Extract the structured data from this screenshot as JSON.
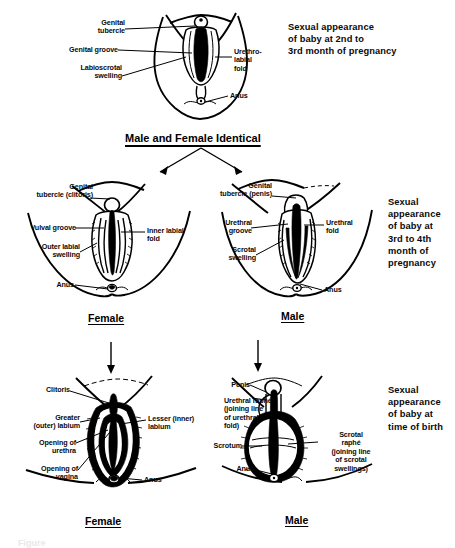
{
  "figure": {
    "title_caption": "Figure",
    "stages": [
      {
        "id": "stage-1",
        "description": "Sexual appearance\nof baby at 2nd to\n3rd month of pregnancy",
        "heading": "Male and Female Identical",
        "panels": [
          {
            "id": "indifferent",
            "sex_label": "",
            "labels": [
              {
                "name": "genital-tubercle",
                "text": "Genital\ntubercle"
              },
              {
                "name": "genital-groove",
                "text": "Genital groove"
              },
              {
                "name": "labioscrotal-swelling",
                "text": "Labioscrotal\nswelling"
              },
              {
                "name": "urethro-labial-fold",
                "text": "Urethro-\nlabial\nfold"
              },
              {
                "name": "anus",
                "text": "Anus"
              }
            ]
          }
        ]
      },
      {
        "id": "stage-2",
        "description": "Sexual\nappearance\nof baby at\n3rd to 4th\nmonth of\npregnancy",
        "heading": "",
        "panels": [
          {
            "id": "female-3to4-month",
            "sex_label": "Female",
            "labels": [
              {
                "name": "genital-tubercle-clitoris",
                "text": "Genital\ntubercle (clitoris)"
              },
              {
                "name": "vulval-groove",
                "text": "Vulval groove"
              },
              {
                "name": "outer-labial-swelling",
                "text": "Outer labial\nswelling"
              },
              {
                "name": "inner-labial-fold",
                "text": "Inner labial\nfold"
              },
              {
                "name": "anus",
                "text": "Anus"
              }
            ]
          },
          {
            "id": "male-3to4-month",
            "sex_label": "Male",
            "labels": [
              {
                "name": "genital-tubercle-penis",
                "text": "Genital\ntubercle (penis)"
              },
              {
                "name": "urethral-groove",
                "text": "Urethral\ngroove"
              },
              {
                "name": "scrotal-swelling",
                "text": "Scrotal\nswelling"
              },
              {
                "name": "urethral-fold",
                "text": "Urethral\nfold"
              },
              {
                "name": "anus",
                "text": "Anus"
              }
            ]
          }
        ]
      },
      {
        "id": "stage-3",
        "description": "Sexual\nappearance\nof baby at\ntime of birth",
        "heading": "",
        "panels": [
          {
            "id": "female-birth",
            "sex_label": "Female",
            "labels": [
              {
                "name": "clitoris",
                "text": "Clitoris"
              },
              {
                "name": "greater-outer-labium",
                "text": "Greater\n(outer) labium"
              },
              {
                "name": "opening-of-urethra",
                "text": "Opening of\nurethra"
              },
              {
                "name": "opening-of-vagina",
                "text": "Opening of\nvagina"
              },
              {
                "name": "lesser-inner-labium",
                "text": "Lesser (inner)\nlabium"
              },
              {
                "name": "anus",
                "text": "Anus"
              }
            ]
          },
          {
            "id": "male-birth",
            "sex_label": "Male",
            "labels": [
              {
                "name": "penis",
                "text": "Penis"
              },
              {
                "name": "urethral-raphe",
                "text": "Urethral raphé\n(joining line\nof urethral\nfold)"
              },
              {
                "name": "scrotum",
                "text": "Scrotum"
              },
              {
                "name": "scrotal-raphe",
                "text": "Scrotal\nraphé\n(joining line\nof scrotal\nswellings)"
              },
              {
                "name": "anus",
                "text": "Anus"
              }
            ]
          }
        ]
      }
    ]
  },
  "colors": {
    "ink": "#000000",
    "paper": "#ffffff"
  }
}
